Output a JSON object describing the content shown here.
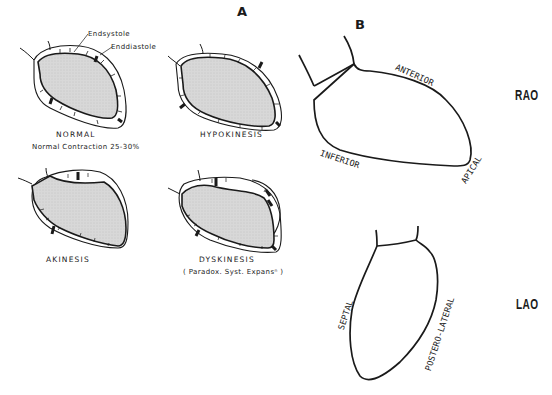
{
  "panels": {
    "a": {
      "letter": "A",
      "legend": {
        "endsystole": "Endsystole",
        "enddiastole": "Enddiastole"
      },
      "diagrams": [
        {
          "id": "normal",
          "title": "NORMAL",
          "subtitle": "Normal Contraction 25-30%"
        },
        {
          "id": "hypokinesis",
          "title": "HYPOKINESIS",
          "subtitle": ""
        },
        {
          "id": "akinesis",
          "title": "AKINESIS",
          "subtitle": ""
        },
        {
          "id": "dyskinesis",
          "title": "DYSKINESIS",
          "subtitle": "( Paradox. Syst. Expansⁿ )"
        }
      ]
    },
    "b": {
      "letter": "B",
      "views": [
        {
          "id": "rao",
          "label": "RAO",
          "segments": [
            "ANTERIOR",
            "INFERIOR",
            "APICAL"
          ]
        },
        {
          "id": "lao",
          "label": "LAO",
          "segments": [
            "SEPTAL",
            "POSTERO-LATERAL"
          ]
        }
      ]
    }
  },
  "colors": {
    "line": "#1a1a1a",
    "fill": "#d9d9d9",
    "background": "#ffffff"
  }
}
